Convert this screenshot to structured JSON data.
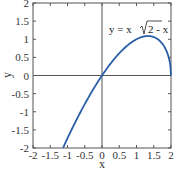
{
  "chart_data": {
    "type": "line",
    "title": "",
    "xlabel": "x",
    "ylabel": "y",
    "xlim": [
      -2,
      2
    ],
    "ylim": [
      -2,
      2
    ],
    "xticks": [
      "-2",
      "-1.5",
      "-1",
      "-0.5",
      "0",
      "0.5",
      "1",
      "1.5",
      "2"
    ],
    "yticks": [
      "-2",
      "-1.5",
      "-1",
      "-0.5",
      "0",
      "0.5",
      "1",
      "1.5",
      "2"
    ],
    "grid": false,
    "axis_lines_through_origin": true,
    "annotation": {
      "text_prefix": "y = x",
      "radicand": "2 - x",
      "x": 0.1,
      "y": 1.1
    },
    "series": [
      {
        "name": "y = x√(2 - x)",
        "color": "#2a5fa8",
        "x": [
          -1.13,
          -1.0,
          -0.75,
          -0.5,
          -0.25,
          0,
          0.25,
          0.5,
          0.75,
          1.0,
          1.25,
          1.333,
          1.5,
          1.75,
          1.9,
          1.97,
          2.0
        ],
        "y": [
          -2.0,
          -1.732,
          -1.244,
          -0.791,
          -0.375,
          0,
          0.331,
          0.612,
          0.839,
          1.0,
          1.083,
          1.089,
          1.061,
          0.875,
          0.601,
          0.341,
          0
        ]
      }
    ]
  }
}
